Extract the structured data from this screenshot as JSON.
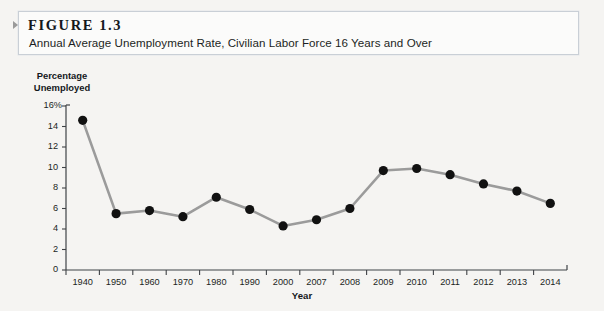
{
  "figure": {
    "marker_icon": "collapse-triangle-icon",
    "label": "FIGURE 1.3",
    "caption": "Annual Average Unemployment Rate, Civilian Labor Force 16 Years and Over"
  },
  "colors": {
    "page_background": "#f5f4f2",
    "title_box_background": "#fbfbfa",
    "title_box_border": "#c9cfd6",
    "axis": "#3f4246",
    "line": "#9b9b9b",
    "marker": "#111111",
    "text": "#1b1f23"
  },
  "chart_data": {
    "type": "line",
    "title": "Annual Average Unemployment Rate, Civilian Labor Force 16 Years and Over",
    "xlabel": "Year",
    "ylabel": "Percentage Unemployed",
    "ylim": [
      0,
      16
    ],
    "yticks": [
      0,
      2,
      4,
      6,
      8,
      10,
      12,
      14,
      16
    ],
    "ytick_labels": [
      "0",
      "2",
      "4",
      "6",
      "8",
      "10",
      "12",
      "14",
      "16%"
    ],
    "grid": false,
    "legend": null,
    "categories": [
      "1940",
      "1950",
      "1960",
      "1970",
      "1980",
      "1990",
      "2000",
      "2007",
      "2008",
      "2009",
      "2010",
      "2011",
      "2012",
      "2013",
      "2014"
    ],
    "values": [
      14.6,
      5.5,
      5.8,
      5.2,
      7.1,
      5.9,
      4.3,
      4.9,
      6.0,
      9.7,
      9.9,
      9.3,
      8.4,
      7.7,
      6.5
    ],
    "series": [
      {
        "name": "Percentage Unemployed",
        "values": [
          14.6,
          5.5,
          5.8,
          5.2,
          7.1,
          5.9,
          4.3,
          4.9,
          6.0,
          9.7,
          9.9,
          9.3,
          8.4,
          7.7,
          6.5
        ]
      }
    ]
  }
}
